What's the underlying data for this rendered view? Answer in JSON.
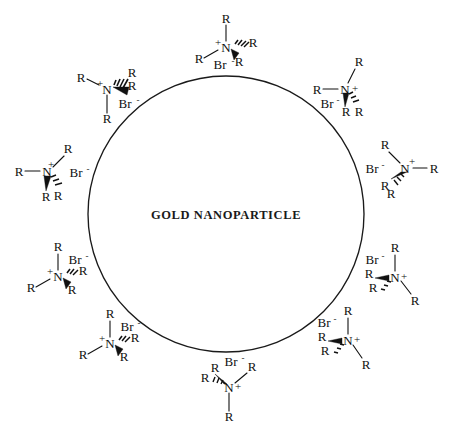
{
  "figure": {
    "background_color": "#ffffff",
    "stroke_color": "#1a1a1a",
    "text_color": "#111111"
  },
  "core": {
    "label": "GOLD  NANOPARTICLE",
    "shape": "circle",
    "center_x": 226,
    "center_y": 214,
    "radius": 138,
    "label_x": 226,
    "label_y": 219
  },
  "labels": {
    "r_group": "R",
    "nitrogen": "N",
    "plus_charge": "+",
    "bromide": "Br",
    "minus_charge": "-"
  },
  "ligands": [
    {
      "id": "ligand-top",
      "position": "top",
      "angle_deg": 270,
      "nx": 226,
      "ny": 47,
      "rotation": 0,
      "nitrogen": "N",
      "charge": "+",
      "counterion": "Br",
      "counterion_charge": "-",
      "substituents": [
        "R",
        "R",
        "R",
        "R"
      ]
    },
    {
      "id": "ligand-upper-left",
      "position": "upper-left",
      "angle_deg": 215,
      "nx": 107,
      "ny": 89,
      "rotation": 0,
      "nitrogen": "N",
      "charge": "+",
      "counterion": "Br",
      "counterion_charge": "-",
      "substituents": [
        "R",
        "R",
        "R",
        "R"
      ]
    },
    {
      "id": "ligand-upper-right",
      "position": "upper-right",
      "angle_deg": 325,
      "nx": 345,
      "ny": 89,
      "rotation": 0,
      "nitrogen": "N",
      "charge": "+",
      "counterion": "Br",
      "counterion_charge": "-",
      "substituents": [
        "R",
        "R",
        "R",
        "R"
      ]
    },
    {
      "id": "ligand-left",
      "position": "left",
      "angle_deg": 180,
      "nx": 47,
      "ny": 171,
      "rotation": 0,
      "nitrogen": "N",
      "charge": "+",
      "counterion": "Br",
      "counterion_charge": "-",
      "substituents": [
        "R",
        "R",
        "R",
        "R"
      ]
    },
    {
      "id": "ligand-right",
      "position": "right",
      "angle_deg": 0,
      "nx": 405,
      "ny": 168,
      "rotation": 0,
      "nitrogen": "N",
      "charge": "+",
      "counterion": "Br",
      "counterion_charge": "-",
      "substituents": [
        "R",
        "R",
        "R",
        "R"
      ]
    },
    {
      "id": "ligand-lower-left",
      "position": "lower-left",
      "angle_deg": 150,
      "nx": 58,
      "ny": 276,
      "rotation": 0,
      "nitrogen": "N",
      "charge": "+",
      "counterion": "Br",
      "counterion_charge": "-",
      "substituents": [
        "R",
        "R",
        "R",
        "R"
      ]
    },
    {
      "id": "ligand-lower-right",
      "position": "lower-right",
      "angle_deg": 30,
      "nx": 395,
      "ny": 277,
      "rotation": 0,
      "nitrogen": "N",
      "charge": "+",
      "counterion": "Br",
      "counterion_charge": "-",
      "substituents": [
        "R",
        "R",
        "R",
        "R"
      ]
    },
    {
      "id": "ligand-bottom-left",
      "position": "bottom-left",
      "angle_deg": 125,
      "nx": 110,
      "ny": 343,
      "rotation": 0,
      "nitrogen": "N",
      "charge": "+",
      "counterion": "Br",
      "counterion_charge": "-",
      "substituents": [
        "R",
        "R",
        "R",
        "R"
      ]
    },
    {
      "id": "ligand-bottom-right",
      "position": "bottom-right",
      "angle_deg": 55,
      "nx": 348,
      "ny": 340,
      "rotation": 0,
      "nitrogen": "N",
      "charge": "+",
      "counterion": "Br",
      "counterion_charge": "-",
      "substituents": [
        "R",
        "R",
        "R",
        "R"
      ]
    },
    {
      "id": "ligand-bottom",
      "position": "bottom",
      "angle_deg": 90,
      "nx": 229,
      "ny": 387,
      "rotation": 0,
      "nitrogen": "N",
      "charge": "+",
      "counterion": "Br",
      "counterion_charge": "-",
      "substituents": [
        "R",
        "R",
        "R",
        "R"
      ]
    }
  ],
  "chart_data": {
    "type": "diagram",
    "title": "GOLD  NANOPARTICLE",
    "core_label": "GOLD  NANOPARTICLE",
    "ligand_count": 10,
    "ligand_formula": "R4N+ Br-",
    "ligand_atoms": [
      "N",
      "R",
      "R",
      "R",
      "R",
      "Br"
    ],
    "legend": []
  }
}
